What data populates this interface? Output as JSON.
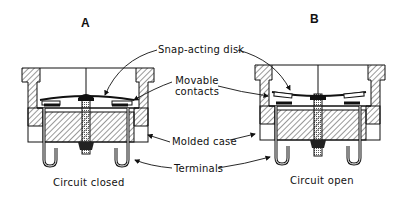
{
  "panels": [
    {
      "letter": "A",
      "caption": "Circuit closed",
      "state": "closed"
    },
    {
      "letter": "B",
      "caption": "Circuit open",
      "state": "open"
    }
  ],
  "labels": {
    "snap_disk": "Snap-acting disk",
    "movable_contacts_line1": "Movable",
    "movable_contacts_line2": "contacts",
    "molded_case": "Molded case",
    "terminals": "Terminals"
  },
  "colors": {
    "ink": "#111111",
    "background": "#ffffff",
    "hatch": "#333333"
  }
}
